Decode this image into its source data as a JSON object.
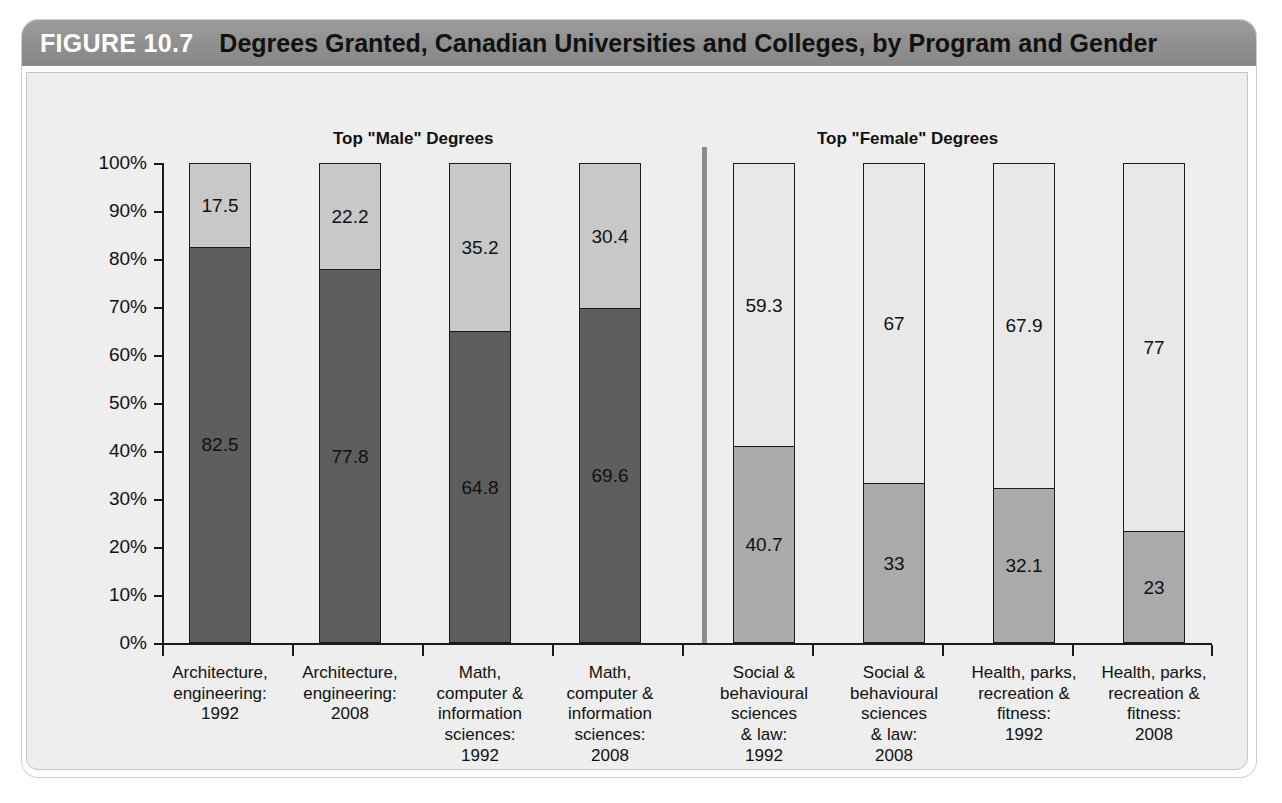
{
  "header": {
    "figure_number": "FIGURE 10.7",
    "title": "Degrees Granted, Canadian Universities and Colleges, by Program and Gender"
  },
  "colors": {
    "header_bar": "#8f8f8f",
    "figure_number_text": "#ffffff",
    "title_text": "#111111",
    "panel_background": "#eeeeee",
    "male_dark": "#5e5e5e",
    "male_light": "#c8c8c8",
    "female_medium": "#aaaaaa",
    "female_light": "#e8e8e8",
    "axis": "#1a1a1a",
    "divider": "#8c8c8c"
  },
  "chart_data": {
    "type": "bar",
    "title": "Degrees Granted, Canadian Universities and Colleges, by Program and Gender",
    "xlabel": "",
    "ylabel": "",
    "ylim": [
      0,
      100
    ],
    "grid": false,
    "stacked": true,
    "stack_total": 100,
    "legend_position": "none",
    "y_ticks": [
      "0%",
      "10%",
      "20%",
      "30%",
      "40%",
      "50%",
      "60%",
      "70%",
      "80%",
      "90%",
      "100%"
    ],
    "y_tick_values": [
      0,
      10,
      20,
      30,
      40,
      50,
      60,
      70,
      80,
      90,
      100
    ],
    "group_titles": [
      "Top \"Male\" Degrees",
      "Top \"Female\" Degrees"
    ],
    "categories": [
      "Architecture, engineering: 1992",
      "Architecture, engineering: 2008",
      "Math, computer & information sciences: 1992",
      "Math, computer & information sciences: 2008",
      "Social & behavioural sciences & law: 1992",
      "Social & behavioural sciences & law: 2008",
      "Health, parks, recreation & fitness: 1992",
      "Health, parks, recreation & fitness: 2008"
    ],
    "category_lines": [
      [
        "Architecture,",
        "engineering:",
        "1992"
      ],
      [
        "Architecture,",
        "engineering:",
        "2008"
      ],
      [
        "Math,",
        "computer &",
        "information",
        "sciences:",
        "1992"
      ],
      [
        "Math,",
        "computer &",
        "information",
        "sciences:",
        "2008"
      ],
      [
        "Social &",
        "behavioural",
        "sciences",
        "& law:",
        "1992"
      ],
      [
        "Social &",
        "behavioural",
        "sciences",
        "& law:",
        "2008"
      ],
      [
        "Health, parks,",
        "recreation &",
        "fitness:",
        "1992"
      ],
      [
        "Health, parks,",
        "recreation &",
        "fitness:",
        "2008"
      ]
    ],
    "series": [
      {
        "name": "Bottom segment",
        "values": [
          82.5,
          77.8,
          64.8,
          69.6,
          40.7,
          33,
          32.1,
          23
        ]
      },
      {
        "name": "Top segment",
        "values": [
          17.5,
          22.2,
          35.2,
          30.4,
          59.3,
          67,
          67.9,
          77
        ]
      }
    ]
  },
  "bars": [
    {
      "group": "male",
      "bottom_value": "82.5",
      "top_value": "17.5",
      "bottom_pct": 82.5,
      "top_pct": 17.5
    },
    {
      "group": "male",
      "bottom_value": "77.8",
      "top_value": "22.2",
      "bottom_pct": 77.8,
      "top_pct": 22.2
    },
    {
      "group": "male",
      "bottom_value": "64.8",
      "top_value": "35.2",
      "bottom_pct": 64.8,
      "top_pct": 35.2
    },
    {
      "group": "male",
      "bottom_value": "69.6",
      "top_value": "30.4",
      "bottom_pct": 69.6,
      "top_pct": 30.4
    },
    {
      "group": "female",
      "bottom_value": "40.7",
      "top_value": "59.3",
      "bottom_pct": 40.7,
      "top_pct": 59.3
    },
    {
      "group": "female",
      "bottom_value": "33",
      "top_value": "67",
      "bottom_pct": 33,
      "top_pct": 67
    },
    {
      "group": "female",
      "bottom_value": "32.1",
      "top_value": "67.9",
      "bottom_pct": 32.1,
      "top_pct": 67.9
    },
    {
      "group": "female",
      "bottom_value": "23",
      "top_value": "77",
      "bottom_pct": 23,
      "top_pct": 77
    }
  ]
}
